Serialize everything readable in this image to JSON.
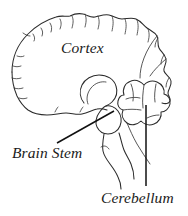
{
  "figure": {
    "kind": "brain-anatomy-line-drawing",
    "view": "lateral",
    "background_color": "#ffffff",
    "ink_color": "#2b2b2b",
    "leader_color": "#111111"
  },
  "labels": {
    "cortex": "Cortex",
    "brain_stem": "Brain Stem",
    "cerebellum": "Cerebellum"
  },
  "structures": [
    {
      "name": "cortex",
      "label": "Cortex"
    },
    {
      "name": "brain-stem",
      "label": "Brain Stem"
    },
    {
      "name": "cerebellum",
      "label": "Cerebellum"
    }
  ],
  "leaders": [
    {
      "name": "brain-stem-leader",
      "from_label": "Brain Stem",
      "x1": 57,
      "y1": 143,
      "x2": 114,
      "y2": 111
    },
    {
      "name": "cerebellum-leader",
      "from_label": "Cerebellum",
      "x1": 146,
      "y1": 105,
      "x2": 146,
      "y2": 186
    }
  ]
}
